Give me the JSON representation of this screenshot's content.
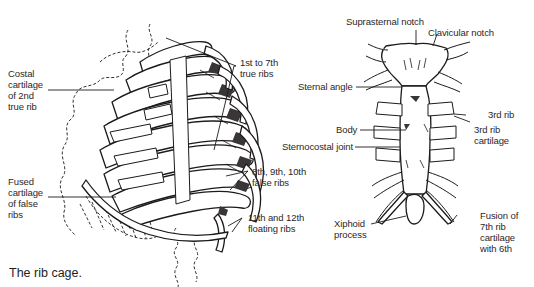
{
  "figure": {
    "caption": "The rib cage.",
    "rib_cage_view": {
      "labels": {
        "costal_cartilage_2nd": "Costal\ncartilage\nof 2nd\ntrue rib",
        "fused_cartilage": "Fused\ncartilage\nof false\nribs",
        "true_ribs": "1st to 7th\ntrue ribs",
        "false_ribs": "8th, 9th, 10th\nfalse ribs",
        "floating_ribs": "11th and 12th\nfloating ribs"
      }
    },
    "sternum_view": {
      "labels": {
        "suprasternal_notch": "Suprasternal notch",
        "clavicular_notch": "Clavicular notch",
        "sternal_angle": "Sternal angle",
        "body": "Body",
        "sternocostal_joint": "Sternocostal joint",
        "third_rib": "3rd rib",
        "third_rib_cartilage": "3rd rib\ncartilage",
        "xiphoid_process": "Xiphoid\nprocess",
        "fusion_7th": "Fusion of\n7th rib\ncartilage\nwith 6th"
      }
    }
  }
}
